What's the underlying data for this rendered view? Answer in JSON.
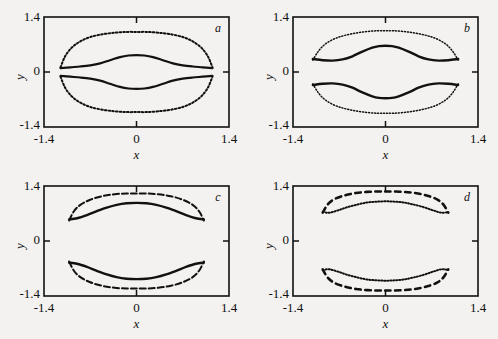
{
  "figure": {
    "background_color": "#f3f2f0",
    "ink_color": "#111111",
    "panel_count": 4
  },
  "axes": {
    "x_label": "x",
    "y_label": "y",
    "x_ticks": [
      "-1.4",
      "0",
      "1.4"
    ],
    "y_ticks": [
      "1.4",
      "0",
      "-1.4"
    ],
    "x_min": -1.4,
    "x_max": 1.4,
    "y_min": -1.4,
    "y_max": 1.4
  },
  "panels": [
    {
      "id": "a",
      "label": "a"
    },
    {
      "id": "b",
      "label": "b"
    },
    {
      "id": "c",
      "label": "c"
    },
    {
      "id": "d",
      "label": "d"
    }
  ],
  "chart_data": {
    "type": "line",
    "title": "",
    "xlabel": "x",
    "ylabel": "y",
    "xlim": [
      -1.4,
      1.4
    ],
    "ylim": [
      -1.4,
      1.4
    ],
    "xticks": [
      -1.4,
      0,
      1.4
    ],
    "yticks": [
      -1.4,
      0,
      1.4
    ],
    "grid": false,
    "legend": "none",
    "subplots": [
      {
        "panel": "a",
        "annotation": "a",
        "description": "Outer dotted closed oval enclosing two solid inner branches that nearly touch at y=0",
        "series": [
          {
            "name": "upper-outer-dotted",
            "style": "dotted",
            "linewidth": 2.0,
            "x": [
              -1.15,
              -1.08,
              -0.98,
              -0.85,
              -0.7,
              -0.52,
              -0.33,
              -0.15,
              0.0,
              0.15,
              0.33,
              0.52,
              0.7,
              0.85,
              0.98,
              1.08,
              1.15
            ],
            "y": [
              0.12,
              0.4,
              0.62,
              0.78,
              0.89,
              0.96,
              1.0,
              1.02,
              1.02,
              1.02,
              1.0,
              0.96,
              0.89,
              0.78,
              0.62,
              0.4,
              0.12
            ]
          },
          {
            "name": "lower-outer-dotted",
            "style": "dotted",
            "linewidth": 2.0,
            "x": [
              -1.15,
              -1.08,
              -0.98,
              -0.85,
              -0.7,
              -0.52,
              -0.33,
              -0.15,
              0.0,
              0.15,
              0.33,
              0.52,
              0.7,
              0.85,
              0.98,
              1.08,
              1.15
            ],
            "y": [
              -0.12,
              -0.4,
              -0.62,
              -0.78,
              -0.89,
              -0.96,
              -1.0,
              -1.02,
              -1.02,
              -1.02,
              -1.0,
              -0.96,
              -0.89,
              -0.78,
              -0.62,
              -0.4,
              -0.12
            ]
          },
          {
            "name": "upper-inner-solid",
            "style": "solid",
            "linewidth": 2.2,
            "x": [
              -1.15,
              -1.0,
              -0.85,
              -0.7,
              -0.55,
              -0.4,
              -0.25,
              -0.12,
              0.0,
              0.12,
              0.25,
              0.4,
              0.55,
              0.7,
              0.85,
              1.0,
              1.15
            ],
            "y": [
              0.1,
              0.12,
              0.14,
              0.17,
              0.22,
              0.3,
              0.38,
              0.42,
              0.43,
              0.42,
              0.38,
              0.3,
              0.22,
              0.17,
              0.14,
              0.12,
              0.1
            ]
          },
          {
            "name": "lower-inner-solid",
            "style": "solid",
            "linewidth": 2.2,
            "x": [
              -1.15,
              -1.0,
              -0.85,
              -0.7,
              -0.55,
              -0.4,
              -0.25,
              -0.12,
              0.0,
              0.12,
              0.25,
              0.4,
              0.55,
              0.7,
              0.85,
              1.0,
              1.15
            ],
            "y": [
              -0.1,
              -0.12,
              -0.14,
              -0.17,
              -0.22,
              -0.3,
              -0.38,
              -0.42,
              -0.43,
              -0.42,
              -0.38,
              -0.3,
              -0.22,
              -0.17,
              -0.14,
              -0.12,
              -0.1
            ]
          }
        ]
      },
      {
        "panel": "b",
        "annotation": "b",
        "description": "Outer finely dotted oval with solid inner branches separated by a visible gap around y=0",
        "series": [
          {
            "name": "upper-outer-dotted",
            "style": "fine-dotted",
            "linewidth": 1.5,
            "x": [
              -1.1,
              -1.02,
              -0.92,
              -0.78,
              -0.62,
              -0.45,
              -0.28,
              -0.12,
              0.0,
              0.12,
              0.28,
              0.45,
              0.62,
              0.78,
              0.92,
              1.02,
              1.1
            ],
            "y": [
              0.3,
              0.52,
              0.7,
              0.84,
              0.93,
              0.99,
              1.03,
              1.05,
              1.05,
              1.05,
              1.03,
              0.99,
              0.93,
              0.84,
              0.7,
              0.52,
              0.3
            ]
          },
          {
            "name": "lower-outer-dotted",
            "style": "fine-dotted",
            "linewidth": 1.5,
            "x": [
              -1.1,
              -1.02,
              -0.92,
              -0.78,
              -0.62,
              -0.45,
              -0.28,
              -0.12,
              0.0,
              0.12,
              0.28,
              0.45,
              0.62,
              0.78,
              0.92,
              1.02,
              1.1
            ],
            "y": [
              -0.3,
              -0.52,
              -0.7,
              -0.84,
              -0.93,
              -0.99,
              -1.03,
              -1.05,
              -1.05,
              -1.05,
              -1.03,
              -0.99,
              -0.93,
              -0.84,
              -0.7,
              -0.52,
              -0.3
            ]
          },
          {
            "name": "upper-inner-solid",
            "style": "solid",
            "linewidth": 2.4,
            "x": [
              -1.1,
              -0.95,
              -0.8,
              -0.65,
              -0.5,
              -0.35,
              -0.2,
              -0.1,
              0.0,
              0.1,
              0.2,
              0.35,
              0.5,
              0.65,
              0.8,
              0.95,
              1.1
            ],
            "y": [
              0.33,
              0.3,
              0.29,
              0.32,
              0.4,
              0.52,
              0.62,
              0.66,
              0.67,
              0.66,
              0.62,
              0.52,
              0.4,
              0.32,
              0.29,
              0.3,
              0.33
            ]
          },
          {
            "name": "lower-inner-solid",
            "style": "solid",
            "linewidth": 2.4,
            "x": [
              -1.1,
              -0.95,
              -0.8,
              -0.65,
              -0.5,
              -0.35,
              -0.2,
              -0.1,
              0.0,
              0.1,
              0.2,
              0.35,
              0.5,
              0.65,
              0.8,
              0.95,
              1.1
            ],
            "y": [
              -0.33,
              -0.3,
              -0.29,
              -0.32,
              -0.4,
              -0.52,
              -0.62,
              -0.66,
              -0.67,
              -0.66,
              -0.62,
              -0.52,
              -0.4,
              -0.32,
              -0.29,
              -0.3,
              -0.33
            ]
          }
        ]
      },
      {
        "panel": "c",
        "annotation": "c",
        "description": "Crescent shaped bands: dashed outer arcs and solid inner arcs, wide central gap",
        "series": [
          {
            "name": "upper-outer-dashed",
            "style": "dashed",
            "linewidth": 2.0,
            "x": [
              -1.02,
              -0.95,
              -0.85,
              -0.7,
              -0.52,
              -0.33,
              -0.15,
              0.0,
              0.15,
              0.33,
              0.52,
              0.7,
              0.85,
              0.95,
              1.02
            ],
            "y": [
              0.52,
              0.75,
              0.92,
              1.05,
              1.14,
              1.19,
              1.21,
              1.21,
              1.21,
              1.19,
              1.14,
              1.05,
              0.92,
              0.75,
              0.52
            ]
          },
          {
            "name": "lower-outer-dashed",
            "style": "dashed",
            "linewidth": 2.0,
            "x": [
              -1.02,
              -0.95,
              -0.85,
              -0.7,
              -0.52,
              -0.33,
              -0.15,
              0.0,
              0.15,
              0.33,
              0.52,
              0.7,
              0.85,
              0.95,
              1.02
            ],
            "y": [
              -0.52,
              -0.75,
              -0.92,
              -1.05,
              -1.14,
              -1.19,
              -1.21,
              -1.21,
              -1.21,
              -1.19,
              -1.14,
              -1.05,
              -0.92,
              -0.75,
              -0.52
            ]
          },
          {
            "name": "upper-inner-solid",
            "style": "solid",
            "linewidth": 2.4,
            "x": [
              -1.02,
              -0.9,
              -0.75,
              -0.6,
              -0.45,
              -0.3,
              -0.15,
              0.0,
              0.15,
              0.3,
              0.45,
              0.6,
              0.75,
              0.9,
              1.02
            ],
            "y": [
              0.55,
              0.58,
              0.66,
              0.76,
              0.85,
              0.92,
              0.96,
              0.97,
              0.96,
              0.92,
              0.85,
              0.76,
              0.66,
              0.58,
              0.55
            ]
          },
          {
            "name": "lower-inner-solid",
            "style": "solid",
            "linewidth": 2.4,
            "x": [
              -1.02,
              -0.9,
              -0.75,
              -0.6,
              -0.45,
              -0.3,
              -0.15,
              0.0,
              0.15,
              0.3,
              0.45,
              0.6,
              0.75,
              0.9,
              1.02
            ],
            "y": [
              -0.55,
              -0.58,
              -0.66,
              -0.76,
              -0.85,
              -0.92,
              -0.96,
              -0.97,
              -0.96,
              -0.92,
              -0.85,
              -0.76,
              -0.66,
              -0.58,
              -0.55
            ]
          }
        ]
      },
      {
        "panel": "d",
        "annotation": "d",
        "description": "Both branches broken: coarse dashes on the outer arcs, fine dots on the inner arcs, widest central gap",
        "series": [
          {
            "name": "upper-outer-dashed",
            "style": "coarse-dashed",
            "linewidth": 2.6,
            "x": [
              -0.95,
              -0.88,
              -0.78,
              -0.62,
              -0.45,
              -0.28,
              -0.12,
              0.0,
              0.12,
              0.28,
              0.45,
              0.62,
              0.78,
              0.88,
              0.95
            ],
            "y": [
              0.72,
              0.92,
              1.06,
              1.16,
              1.22,
              1.25,
              1.26,
              1.26,
              1.26,
              1.25,
              1.22,
              1.16,
              1.06,
              0.92,
              0.72
            ]
          },
          {
            "name": "lower-outer-dashed",
            "style": "coarse-dashed",
            "linewidth": 2.6,
            "x": [
              -0.95,
              -0.88,
              -0.78,
              -0.62,
              -0.45,
              -0.28,
              -0.12,
              0.0,
              0.12,
              0.28,
              0.45,
              0.62,
              0.78,
              0.88,
              0.95
            ],
            "y": [
              -0.72,
              -0.92,
              -1.06,
              -1.16,
              -1.22,
              -1.25,
              -1.26,
              -1.26,
              -1.26,
              -1.25,
              -1.22,
              -1.16,
              -1.06,
              -0.92,
              -0.72
            ]
          },
          {
            "name": "upper-inner-dotted",
            "style": "fine-dotted",
            "linewidth": 2.0,
            "x": [
              -0.95,
              -0.85,
              -0.72,
              -0.58,
              -0.42,
              -0.28,
              -0.14,
              0.0,
              0.14,
              0.28,
              0.42,
              0.58,
              0.72,
              0.85,
              0.95
            ],
            "y": [
              0.74,
              0.72,
              0.78,
              0.86,
              0.93,
              0.98,
              1.0,
              1.01,
              1.0,
              0.98,
              0.93,
              0.86,
              0.78,
              0.72,
              0.74
            ]
          },
          {
            "name": "lower-inner-dotted",
            "style": "fine-dotted",
            "linewidth": 2.0,
            "x": [
              -0.95,
              -0.85,
              -0.72,
              -0.58,
              -0.42,
              -0.28,
              -0.14,
              0.0,
              0.14,
              0.28,
              0.42,
              0.58,
              0.72,
              0.85,
              0.95
            ],
            "y": [
              -0.74,
              -0.72,
              -0.78,
              -0.86,
              -0.93,
              -0.98,
              -1.0,
              -1.01,
              -1.0,
              -0.98,
              -0.93,
              -0.86,
              -0.78,
              -0.72,
              -0.74
            ]
          }
        ]
      }
    ]
  }
}
